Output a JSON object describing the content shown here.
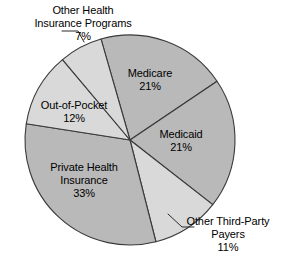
{
  "chart_data": {
    "type": "pie",
    "title": "",
    "subtitle": "",
    "xlabel": "",
    "ylabel": "",
    "legend_position": "none",
    "grid": false,
    "units": "percent",
    "categories": [
      "Medicare",
      "Medicaid",
      "Other Third-Party Payers",
      "Private Health Insurance",
      "Out-of-Pocket",
      "Other Health Insurance Programs"
    ],
    "values": [
      21,
      21,
      11,
      33,
      12,
      7
    ],
    "slices": [
      {
        "label": "Medicare",
        "value": 21,
        "value_text": "21%",
        "color": "#b9b9b9",
        "label_placement": "inside",
        "label_lines": [
          "Medicare",
          "21%"
        ]
      },
      {
        "label": "Medicaid",
        "value": 21,
        "value_text": "21%",
        "color": "#b9b9b9",
        "label_placement": "inside",
        "label_lines": [
          "Medicaid",
          "21%"
        ]
      },
      {
        "label": "Other Third-Party Payers",
        "value": 11,
        "value_text": "11%",
        "color": "#d9d9d9",
        "label_placement": "outside",
        "label_lines": [
          "Other Third-Party",
          "Payers",
          "11%"
        ]
      },
      {
        "label": "Private Health Insurance",
        "value": 33,
        "value_text": "33%",
        "color": "#b9b9b9",
        "label_placement": "inside",
        "label_lines": [
          "Private Health",
          "Insurance",
          "33%"
        ]
      },
      {
        "label": "Out-of-Pocket",
        "value": 12,
        "value_text": "12%",
        "color": "#d9d9d9",
        "label_placement": "inside",
        "label_lines": [
          "Out-of-Pocket",
          "12%"
        ]
      },
      {
        "label": "Other Health Insurance Programs",
        "value": 7,
        "value_text": "7%",
        "color": "#d9d9d9",
        "label_placement": "outside",
        "label_lines": [
          "Other Health",
          "Insurance Programs",
          "7%"
        ]
      }
    ]
  },
  "labels": {
    "other_health_insurance_programs": {
      "line1": "Other Health",
      "line2": "Insurance Programs",
      "line3": "7%"
    },
    "medicare": {
      "line1": "Medicare",
      "line2": "21%"
    },
    "medicaid": {
      "line1": "Medicaid",
      "line2": "21%"
    },
    "other_third_party_payers": {
      "line1": "Other Third-Party",
      "line2": "Payers",
      "line3": "11%"
    },
    "private_health_insurance": {
      "line1": "Private Health",
      "line2": "Insurance",
      "line3": "33%"
    },
    "out_of_pocket": {
      "line1": "Out-of-Pocket",
      "line2": "12%"
    }
  },
  "colors": {
    "slice_dark": "#b9b9b9",
    "slice_light": "#d9d9d9",
    "outline": "#3a3a3a",
    "background": "#ffffff",
    "text": "#000000",
    "leader_line": "#2b2b2b"
  }
}
